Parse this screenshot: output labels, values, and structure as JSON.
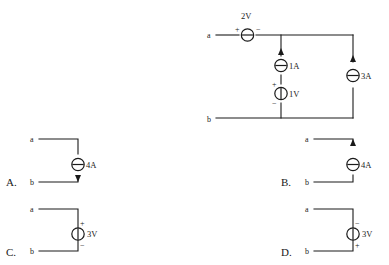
{
  "page": {
    "faint_header": "",
    "background": "#ffffff",
    "ink": "#1a1a1a"
  },
  "main_circuit": {
    "name": "main-circuit",
    "terminal_top": "a",
    "terminal_bottom": "b",
    "sources": [
      {
        "id": "v-2v",
        "label": "2V",
        "type": "voltage-source-horizontal",
        "symbol": "circle-with-horizontal-bar",
        "orientation": "horizontal",
        "plus_side": "left",
        "minus_side": "right",
        "plus": "+",
        "minus": "−",
        "branch": "top-rail-between-a-and-node"
      },
      {
        "id": "i-1a",
        "label": "1A",
        "type": "current-source",
        "symbol": "circle-with-horizontal-bar",
        "orientation": "vertical",
        "arrow_direction": "up",
        "branch": "middle-upper"
      },
      {
        "id": "v-1v",
        "label": "1V",
        "type": "voltage-source",
        "symbol": "circle-with-vertical-bar",
        "orientation": "vertical",
        "plus_side": "top",
        "minus_side": "bottom",
        "plus": "+",
        "minus": "−",
        "branch": "middle-lower"
      },
      {
        "id": "i-3a",
        "label": "3A",
        "type": "current-source",
        "symbol": "circle-with-horizontal-bar",
        "orientation": "vertical",
        "arrow_direction": "up",
        "branch": "right"
      }
    ]
  },
  "options": [
    {
      "id": "option-a",
      "letter": "A.",
      "terminal_top": "a",
      "terminal_bottom": "b",
      "source_label": "4A",
      "source_type": "current-source",
      "symbol": "circle-with-horizontal-bar",
      "arrow_direction": "down",
      "plus": "",
      "minus": ""
    },
    {
      "id": "option-b",
      "letter": "B.",
      "terminal_top": "a",
      "terminal_bottom": "b",
      "source_label": "4A",
      "source_type": "current-source",
      "symbol": "circle-with-horizontal-bar",
      "arrow_direction": "up",
      "plus": "",
      "minus": ""
    },
    {
      "id": "option-c",
      "letter": "C.",
      "terminal_top": "a",
      "terminal_bottom": "b",
      "source_label": "3V",
      "source_type": "voltage-source",
      "symbol": "circle-with-vertical-bar",
      "arrow_direction": "none",
      "plus": "+",
      "minus": "−",
      "plus_side": "top",
      "minus_side": "bottom"
    },
    {
      "id": "option-d",
      "letter": "D.",
      "terminal_top": "a",
      "terminal_bottom": "b",
      "source_label": "3V",
      "source_type": "voltage-source",
      "symbol": "circle-with-vertical-bar",
      "arrow_direction": "none",
      "plus": "+",
      "minus": "−",
      "plus_side": "bottom",
      "minus_side": "top"
    }
  ]
}
